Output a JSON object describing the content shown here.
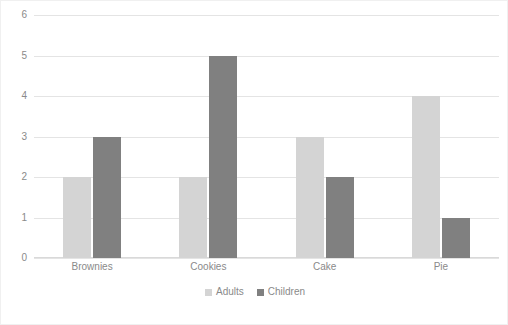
{
  "chart_data": {
    "type": "bar",
    "title": "",
    "subtitle": "",
    "xlabel": "",
    "ylabel": "",
    "categories": [
      "Brownies",
      "Cookies",
      "Cake",
      "Pie"
    ],
    "series": [
      {
        "name": "Adults",
        "color": "#d4d4d4",
        "values": [
          2,
          2,
          3,
          4
        ]
      },
      {
        "name": "Children",
        "color": "#808080",
        "values": [
          3,
          5,
          2,
          1
        ]
      }
    ],
    "ylim": [
      0,
      6
    ],
    "ytick_labels": [
      "0",
      "1",
      "2",
      "3",
      "4",
      "5",
      "6"
    ],
    "ytick_values": [
      0,
      1,
      2,
      3,
      4,
      5,
      6
    ],
    "grid": true,
    "grid_axis": "y",
    "legend_position": "bottom",
    "legend_entries": [
      "Adults",
      "Children"
    ],
    "annotations": [],
    "colors": {
      "adults": "#d4d4d4",
      "children": "#808080",
      "gridline": "#e4e4e4",
      "text": "#8a8a8a",
      "background": "#ffffff",
      "border": "#f0f0f0"
    }
  }
}
